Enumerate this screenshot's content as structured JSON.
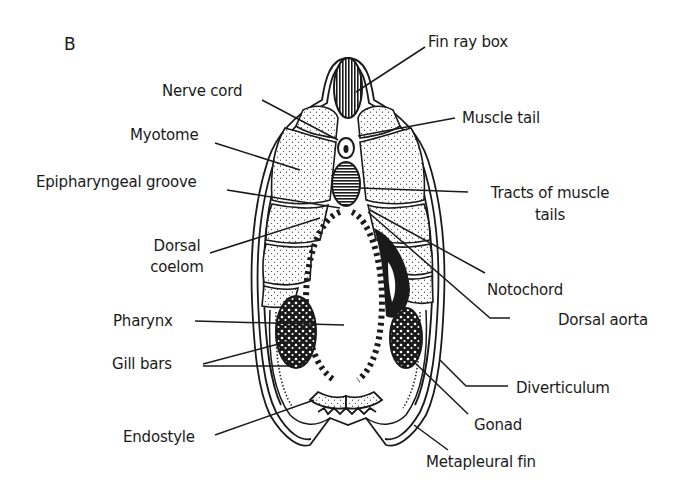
{
  "figure": {
    "panel_letter": "B",
    "ink_color": "#1a1a1a",
    "background": "#ffffff"
  },
  "labels": {
    "fin_ray_box": "Fin ray box",
    "nerve_cord": "Nerve cord",
    "muscle_tail": "Muscle tail",
    "myotome": "Myotome",
    "epipharyngeal_groove": "Epipharyngeal groove",
    "tracts_line1": "Tracts of muscle",
    "tracts_line2": "tails",
    "dorsal_coelom_line1": "Dorsal",
    "dorsal_coelom_line2": "coelom",
    "notochord": "Notochord",
    "dorsal_aorta": "Dorsal aorta",
    "pharynx": "Pharynx",
    "gill_bars": "Gill bars",
    "diverticulum": "Diverticulum",
    "gonad": "Gonad",
    "endostyle": "Endostyle",
    "metapleural_fin": "Metapleural fin"
  }
}
